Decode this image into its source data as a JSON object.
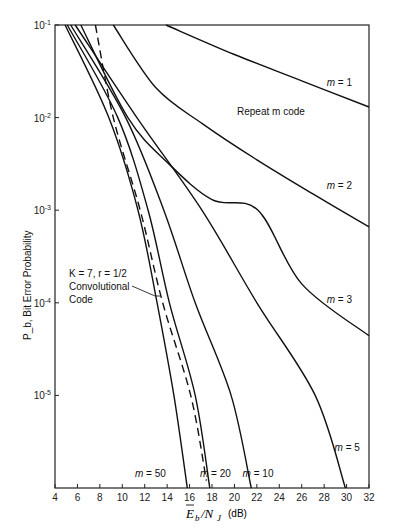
{
  "chart_data": {
    "type": "line",
    "title": "",
    "xlabel": "E_b/N_J (dB)",
    "ylabel": "P_b, Bit Error Probability",
    "xlim": [
      4,
      32
    ],
    "ylim": [
      1e-06,
      0.1
    ],
    "yscale": "log",
    "grid": false,
    "x_ticks": [
      4,
      6,
      8,
      10,
      12,
      14,
      16,
      18,
      20,
      22,
      24,
      26,
      28,
      30,
      32
    ],
    "y_ticks": [
      "10^-1",
      "10^-2",
      "10^-3",
      "10^-4",
      "10^-5"
    ],
    "annotations": [
      {
        "text": "Repeat m code",
        "x": 20.6,
        "y": 0.015
      },
      {
        "text": "K = 7, r = 1/2 Convolutional Code",
        "x": 6.2,
        "y": 0.00015,
        "arrow_to": [
          13.4,
          0.00011
        ]
      }
    ],
    "series": [
      {
        "name": "m = 1",
        "style": "solid",
        "points": [
          [
            13.9,
            0.1
          ],
          [
            20,
            0.048
          ],
          [
            26,
            0.025
          ],
          [
            32,
            0.013
          ]
        ]
      },
      {
        "name": "m = 2",
        "style": "solid",
        "points": [
          [
            9.2,
            0.1
          ],
          [
            13.0,
            0.021
          ],
          [
            17.2,
            0.0085
          ],
          [
            22.0,
            0.0035
          ],
          [
            27.0,
            0.0015
          ],
          [
            32,
            0.00066
          ]
        ]
      },
      {
        "name": "m = 3",
        "style": "solid",
        "points": [
          [
            6.3,
            0.1
          ],
          [
            10.5,
            0.01
          ],
          [
            14.0,
            0.0033
          ],
          [
            18.0,
            0.0013
          ],
          [
            22.1,
            0.001
          ],
          [
            26.0,
            0.00016
          ],
          [
            32,
            4.4e-05
          ]
        ]
      },
      {
        "name": "m = 5",
        "style": "solid",
        "points": [
          [
            5.8,
            0.1
          ],
          [
            11.3,
            0.01
          ],
          [
            17.1,
            0.001
          ],
          [
            22.0,
            0.0001
          ],
          [
            27.2,
            1e-05
          ],
          [
            29.9,
            1e-06
          ]
        ]
      },
      {
        "name": "m = 10",
        "style": "solid",
        "points": [
          [
            5.4,
            0.1
          ],
          [
            10.3,
            0.01
          ],
          [
            13.7,
            0.001
          ],
          [
            16.5,
            0.0001
          ],
          [
            19.7,
            1e-05
          ],
          [
            21.5,
            1e-06
          ]
        ]
      },
      {
        "name": "m = 20",
        "style": "solid",
        "points": [
          [
            5.1,
            0.1
          ],
          [
            9.6,
            0.01
          ],
          [
            12.3,
            0.001
          ],
          [
            14.2,
            0.0001
          ],
          [
            16.5,
            1e-05
          ],
          [
            17.8,
            1e-06
          ]
        ]
      },
      {
        "name": "m = 50",
        "style": "solid",
        "points": [
          [
            4.9,
            0.1
          ],
          [
            8.8,
            0.01
          ],
          [
            11.4,
            0.001
          ],
          [
            13.1,
            0.0001
          ],
          [
            14.6,
            1e-05
          ],
          [
            15.8,
            1e-06
          ]
        ]
      },
      {
        "name": "K = 7, r = 1/2 Convolutional Code",
        "style": "dashed",
        "points": [
          [
            7.6,
            0.1
          ],
          [
            9.2,
            0.01
          ],
          [
            11.6,
            0.001
          ],
          [
            13.6,
            0.0001
          ],
          [
            16.1,
            1e-05
          ],
          [
            17.5,
            1.2e-06
          ]
        ]
      }
    ],
    "curve_labels": [
      {
        "text": "m = 1",
        "x": 29.3,
        "y": 0.022
      },
      {
        "text": "m = 2",
        "x": 29.3,
        "y": 0.0017
      },
      {
        "text": "m = 3",
        "x": 29.3,
        "y": 0.0001
      },
      {
        "text": "m = 5",
        "x": 30.0,
        "y": 2.5e-06
      },
      {
        "text": "m = 10",
        "x": 21.8,
        "y": 1.3e-06
      },
      {
        "text": "m = 20",
        "x": 18.0,
        "y": 1.3e-06
      },
      {
        "text": "m = 50",
        "x": 12.2,
        "y": 1.3e-06
      }
    ]
  },
  "axis": {
    "x_label_main": "E",
    "x_label_sub_b": "b",
    "x_label_slash": "/N",
    "x_label_sub_j": "J",
    "x_label_unit": "(dB)",
    "y_label": "P_b, Bit Error Probability"
  },
  "labels": {
    "repeat": "Repeat m code",
    "conv_line1": "K = 7,  r = 1/2",
    "conv_line2": "Convolutional",
    "conv_line3": "Code"
  }
}
